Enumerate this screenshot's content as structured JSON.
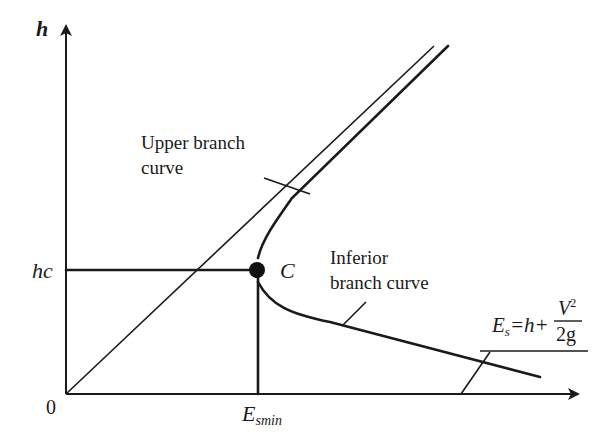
{
  "diagram": {
    "axes": {
      "y_label": "h",
      "origin_label": "0"
    },
    "labels": {
      "hc": "hc",
      "critical_point": "C",
      "esmin_main": "E",
      "esmin_sub": "smin",
      "upper_line1": "Upper branch",
      "upper_line2": "curve",
      "inferior_line1": "Inferior",
      "inferior_line2": "branch curve",
      "formula_lhs": "E",
      "formula_lhs_sub": "s",
      "formula_mid": "=h+",
      "formula_num": "V",
      "formula_num_sup": "2",
      "formula_den": "2g"
    },
    "elements": [
      "y-axis with arrow",
      "x-axis with arrow",
      "45-degree line E=h",
      "upper branch curve",
      "inferior branch curve",
      "critical point C",
      "hc horizontal dashed reference",
      "Esmin vertical reference"
    ]
  }
}
